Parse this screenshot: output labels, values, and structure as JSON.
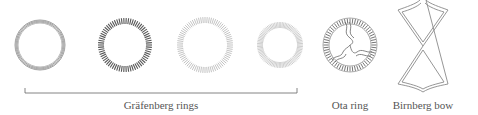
{
  "figure": {
    "devices": [
      {
        "id": "grafenberg-ring-1",
        "style": "plain-wire",
        "cx": 40,
        "cy": 45,
        "r": 24
      },
      {
        "id": "grafenberg-ring-2",
        "style": "dense-coil",
        "cx": 125,
        "cy": 45,
        "r": 24
      },
      {
        "id": "grafenberg-ring-3",
        "style": "sparse-coil",
        "cx": 205,
        "cy": 45,
        "r": 25
      },
      {
        "id": "grafenberg-ring-4",
        "style": "fine-coil",
        "cx": 280,
        "cy": 45,
        "r": 20
      },
      {
        "id": "ota-ring",
        "style": "coil-with-inner-arms",
        "cx": 350,
        "cy": 45,
        "r": 24
      },
      {
        "id": "birnberg-bow",
        "style": "figure-eight-bow"
      }
    ],
    "labels": {
      "grafenberg": "Gräfenberg rings",
      "ota": "Ota ring",
      "birnberg": "Birnberg bow"
    },
    "colors": {
      "stroke": "#8a8a8a",
      "dark_stroke": "#666666",
      "text": "#555555"
    }
  }
}
